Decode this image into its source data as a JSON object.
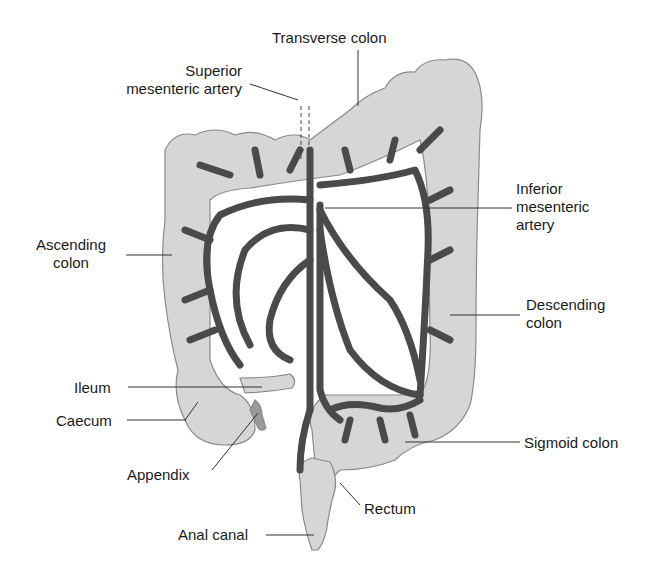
{
  "colors": {
    "colon_fill": "#d6d6d6",
    "colon_stroke": "#8a8a8a",
    "artery": "#4a4a4a",
    "leader": "#333333",
    "text": "#1a1a1a",
    "background": "#ffffff"
  },
  "labels": {
    "transverse_colon": "Transverse colon",
    "superior_mesenteric_artery_l1": "Superior",
    "superior_mesenteric_artery_l2": "mesenteric artery",
    "inferior_mesenteric_artery_l1": "Inferior",
    "inferior_mesenteric_artery_l2": "mesenteric",
    "inferior_mesenteric_artery_l3": "artery",
    "ascending_colon_l1": "Ascending",
    "ascending_colon_l2": "colon",
    "descending_colon_l1": "Descending",
    "descending_colon_l2": "colon",
    "ileum": "Ileum",
    "caecum": "Caecum",
    "appendix": "Appendix",
    "sigmoid_colon": "Sigmoid colon",
    "rectum": "Rectum",
    "anal_canal": "Anal canal"
  }
}
